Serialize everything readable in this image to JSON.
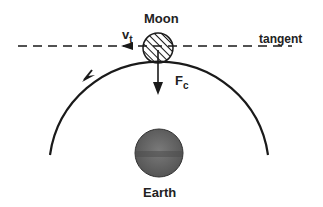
{
  "labels": {
    "moon": "Moon",
    "earth": "Earth",
    "tangent": "tangent",
    "velocity": "v",
    "velocity_sub": "t",
    "force": "F",
    "force_sub": "c"
  },
  "colors": {
    "line": "#1a1a1a",
    "earth_fill": "#6a6a6a",
    "background": "#ffffff"
  }
}
